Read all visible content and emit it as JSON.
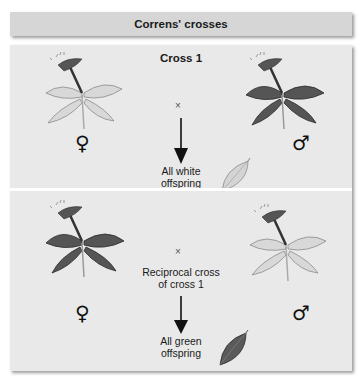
{
  "header": {
    "title": "Correns' crosses"
  },
  "cross1": {
    "title": "Cross 1",
    "cross_symbol": "×",
    "female_symbol": "♀",
    "male_symbol": "♂",
    "female_plant": "white-variegated",
    "male_plant": "green",
    "result_line1": "All white",
    "result_line2": "offspring",
    "offspring_leaf": "white"
  },
  "cross2": {
    "cross_symbol": "×",
    "caption_line1": "Reciprocal cross",
    "caption_line2": "of cross 1",
    "female_symbol": "♀",
    "male_symbol": "♂",
    "female_plant": "green",
    "male_plant": "white-variegated",
    "result_line1": "All green",
    "result_line2": "offspring",
    "offspring_leaf": "green"
  },
  "colors": {
    "header_bg": "#d6d6d6",
    "panel_bg": "#e9e9e9",
    "green_leaf": "#4a4a4a",
    "white_leaf": "#d2d2d2"
  }
}
